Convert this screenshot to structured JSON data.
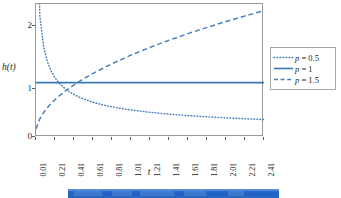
{
  "chart_data": {
    "type": "line",
    "title": "",
    "xlabel": "t",
    "ylabel": "h(t)",
    "xlim": [
      0.01,
      2.41
    ],
    "ylim": [
      0,
      2.45
    ],
    "grid": false,
    "legend_position": "right",
    "x_tick_labels": [
      "0.01",
      "0.21",
      "0.41",
      "0.61",
      "0.81",
      "1.01",
      "1.21",
      "1.41",
      "1.61",
      "1.81",
      "2.01",
      "2.21",
      "2.41"
    ],
    "x_tick_values": [
      0.01,
      0.21,
      0.41,
      0.61,
      0.81,
      1.01,
      1.21,
      1.41,
      1.61,
      1.81,
      2.01,
      2.21,
      2.41
    ],
    "y_tick_labels": [
      "0",
      "1",
      "2"
    ],
    "y_tick_values": [
      0,
      1,
      2
    ],
    "series": [
      {
        "name": "p = 0.5",
        "legend_label": "p = 0.5",
        "style": "dotted",
        "color": "#4a80bd",
        "x": [
          0.01,
          0.05,
          0.09,
          0.13,
          0.17,
          0.21,
          0.25,
          0.31,
          0.37,
          0.41,
          0.49,
          0.61,
          0.71,
          0.81,
          0.91,
          1.01,
          1.21,
          1.41,
          1.61,
          1.81,
          2.01,
          2.21,
          2.41
        ],
        "values": [
          5.0,
          2.236,
          1.667,
          1.387,
          1.213,
          1.091,
          1.0,
          0.898,
          0.822,
          0.781,
          0.714,
          0.64,
          0.593,
          0.556,
          0.524,
          0.498,
          0.455,
          0.421,
          0.394,
          0.372,
          0.353,
          0.336,
          0.322
        ]
      },
      {
        "name": "p = 1",
        "legend_label": "p = 1",
        "style": "solid",
        "color": "#3b78b5",
        "x": [
          0.01,
          0.41,
          0.81,
          1.21,
          1.61,
          2.01,
          2.41
        ],
        "values": [
          1.0,
          1.0,
          1.0,
          1.0,
          1.0,
          1.0,
          1.0
        ]
      },
      {
        "name": "p = 1.5",
        "legend_label": "p = 1.5",
        "style": "dashed",
        "color": "#4a80bd",
        "x": [
          0.01,
          0.05,
          0.09,
          0.13,
          0.17,
          0.21,
          0.25,
          0.31,
          0.41,
          0.51,
          0.61,
          0.81,
          1.01,
          1.21,
          1.41,
          1.61,
          1.81,
          2.01,
          2.21,
          2.41
        ],
        "values": [
          0.15,
          0.335,
          0.45,
          0.541,
          0.619,
          0.687,
          0.75,
          0.835,
          0.96,
          1.071,
          1.171,
          1.35,
          1.508,
          1.651,
          1.782,
          1.904,
          2.019,
          2.127,
          2.23,
          2.328
        ]
      }
    ]
  },
  "legend": {
    "items": [
      {
        "label": "p = 0.5",
        "p_symbol": "p",
        "value_text": " = 0.5",
        "style": "dotted"
      },
      {
        "label": "p = 1",
        "p_symbol": "p",
        "value_text": " = 1",
        "style": "solid"
      },
      {
        "label": "p = 1.5",
        "p_symbol": "p",
        "value_text": " = 1.5",
        "style": "dashed"
      }
    ]
  },
  "axes": {
    "y_label": "h(t)",
    "y_label_h": "h",
    "y_label_t": "t",
    "x_label": "t"
  },
  "colors": {
    "line_blue": "#4a80bd",
    "solid_blue": "#3b78b5",
    "frame_gray": "#9a9a9a",
    "legend_border": "#a6a6a6",
    "chrome_blue": "#2463c6"
  },
  "window_chrome": {
    "present": true
  }
}
